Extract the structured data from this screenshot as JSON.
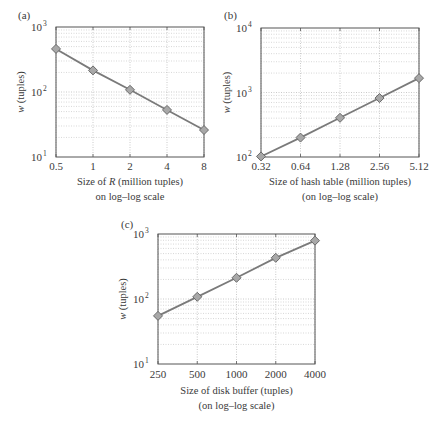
{
  "chart_data": [
    {
      "panel": "(a)",
      "type": "line",
      "scale": "log-log",
      "x": [
        0.5,
        1,
        2,
        4,
        8
      ],
      "x_tick_labels": [
        "0.5",
        "1",
        "2",
        "4",
        "8"
      ],
      "values": [
        460,
        215,
        108,
        53,
        26
      ],
      "ylim": [
        10,
        1000
      ],
      "y_tick_labels": [
        {
          "base": "10",
          "exp": "1"
        },
        {
          "base": "10",
          "exp": "2"
        },
        {
          "base": "10",
          "exp": "3"
        }
      ],
      "ylabel": "w (tuples)",
      "xlabel": [
        "Size of R (million tuples)",
        "on log–log scale"
      ],
      "grid": true,
      "marker": "diamond",
      "title": ""
    },
    {
      "panel": "(b)",
      "type": "line",
      "scale": "log-log",
      "x": [
        0.32,
        0.64,
        1.28,
        2.56,
        5.12
      ],
      "x_tick_labels": [
        "0.32",
        "0.64",
        "1.28",
        "2.56",
        "5.12"
      ],
      "values": [
        102,
        200,
        405,
        820,
        1670
      ],
      "ylim": [
        100,
        10000
      ],
      "y_tick_labels": [
        {
          "base": "10",
          "exp": "2"
        },
        {
          "base": "10",
          "exp": "3"
        },
        {
          "base": "10",
          "exp": "4"
        }
      ],
      "ylabel": "w (tuples)",
      "xlabel": [
        "Size of hash table (million tuples)",
        "(on log–log scale)"
      ],
      "grid": true,
      "marker": "diamond",
      "title": ""
    },
    {
      "panel": "(c)",
      "type": "line",
      "scale": "log-log",
      "x": [
        250,
        500,
        1000,
        2000,
        4000
      ],
      "x_tick_labels": [
        "250",
        "500",
        "1000",
        "2000",
        "4000"
      ],
      "values": [
        55,
        108,
        212,
        430,
        790
      ],
      "ylim": [
        10,
        1000
      ],
      "y_tick_labels": [
        {
          "base": "10",
          "exp": "1"
        },
        {
          "base": "10",
          "exp": "2"
        },
        {
          "base": "10",
          "exp": "3"
        }
      ],
      "ylabel": "w (tuples)",
      "xlabel": [
        "Size of disk buffer (tuples)",
        "(on log–log scale)"
      ],
      "grid": true,
      "marker": "diamond",
      "title": ""
    }
  ],
  "colors": {
    "line": "#7a7a7a",
    "marker_fill": "#a8a8a8",
    "marker_stroke": "#6a6a6a",
    "axis": "#555555",
    "grid": "#bdbdbd",
    "text": "#3a3a3a"
  }
}
